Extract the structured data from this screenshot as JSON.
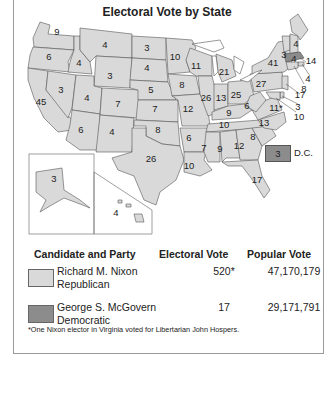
{
  "title": "Electoral Vote by State",
  "colors": {
    "republican": "#d9d9d9",
    "democratic": "#8c8c8c",
    "border": "#555555"
  },
  "states": [
    {
      "state": "WA",
      "ev": "9"
    },
    {
      "state": "OR",
      "ev": "6"
    },
    {
      "state": "CA",
      "ev": "45"
    },
    {
      "state": "ID",
      "ev": "4"
    },
    {
      "state": "NV",
      "ev": "3"
    },
    {
      "state": "MT",
      "ev": "4"
    },
    {
      "state": "WY",
      "ev": "3"
    },
    {
      "state": "UT",
      "ev": "4"
    },
    {
      "state": "AZ",
      "ev": "6"
    },
    {
      "state": "CO",
      "ev": "7"
    },
    {
      "state": "NM",
      "ev": "4"
    },
    {
      "state": "ND",
      "ev": "3"
    },
    {
      "state": "SD",
      "ev": "4"
    },
    {
      "state": "NE",
      "ev": "5"
    },
    {
      "state": "KS",
      "ev": "7"
    },
    {
      "state": "OK",
      "ev": "8"
    },
    {
      "state": "TX",
      "ev": "26"
    },
    {
      "state": "MN",
      "ev": "10"
    },
    {
      "state": "IA",
      "ev": "8"
    },
    {
      "state": "MO",
      "ev": "12"
    },
    {
      "state": "AR",
      "ev": "6"
    },
    {
      "state": "LA",
      "ev": "10"
    },
    {
      "state": "WI",
      "ev": "11"
    },
    {
      "state": "IL",
      "ev": "26"
    },
    {
      "state": "MI",
      "ev": "21"
    },
    {
      "state": "IN",
      "ev": "13"
    },
    {
      "state": "OH",
      "ev": "25"
    },
    {
      "state": "KY",
      "ev": "9"
    },
    {
      "state": "TN",
      "ev": "10"
    },
    {
      "state": "MS",
      "ev": "7"
    },
    {
      "state": "AL",
      "ev": "9"
    },
    {
      "state": "GA",
      "ev": "12"
    },
    {
      "state": "FL",
      "ev": "17"
    },
    {
      "state": "SC",
      "ev": "8"
    },
    {
      "state": "NC",
      "ev": "13"
    },
    {
      "state": "VA",
      "ev": "11*"
    },
    {
      "state": "WV",
      "ev": "6"
    },
    {
      "state": "PA",
      "ev": "27"
    },
    {
      "state": "NY",
      "ev": "41"
    },
    {
      "state": "VT",
      "ev": "3"
    },
    {
      "state": "NH",
      "ev": "4"
    },
    {
      "state": "ME",
      "ev": "4"
    },
    {
      "state": "MA",
      "ev": "14",
      "winner": "Democratic"
    },
    {
      "state": "RI",
      "ev": "4"
    },
    {
      "state": "CT",
      "ev": "8"
    },
    {
      "state": "NJ",
      "ev": "17"
    },
    {
      "state": "DE",
      "ev": "3"
    },
    {
      "state": "MD",
      "ev": "10"
    },
    {
      "state": "AK",
      "ev": "3"
    },
    {
      "state": "HI",
      "ev": "4"
    }
  ],
  "dc": {
    "ev": "3",
    "label": "D.C."
  },
  "legend": {
    "headers": {
      "candidate": "Candidate and Party",
      "electoral": "Electoral Vote",
      "popular": "Popular Vote"
    },
    "rows": [
      {
        "name": "Richard M. Nixon",
        "party": "Republican",
        "electoral": "520*",
        "popular": "47,170,179"
      },
      {
        "name": "George S. McGovern",
        "party": "Democratic",
        "electoral": "17",
        "popular": "29,171,791"
      }
    ]
  },
  "footnote": "*One Nixon elector in Virginia voted for Libertarian John Hospers."
}
